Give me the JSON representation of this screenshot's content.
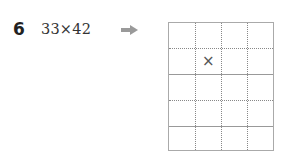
{
  "problem": {
    "number": "6",
    "expression": "33×42",
    "arrow_icon": "right-arrow-icon"
  },
  "grid": {
    "columns": 4,
    "rows": 5,
    "marks": [
      {
        "row": 1,
        "col": 1,
        "symbol": "×"
      }
    ]
  }
}
